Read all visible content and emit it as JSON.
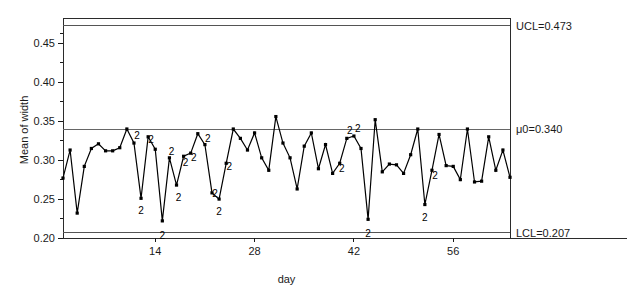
{
  "chart_data": {
    "type": "line",
    "title": "",
    "subtitle": "",
    "xlabel": "day",
    "ylabel": "Mean of width",
    "xlim": [
      1,
      64
    ],
    "ylim": [
      0.2,
      0.4775
    ],
    "grid": false,
    "legend": null,
    "x_ticks": [
      14,
      28,
      42,
      56
    ],
    "x_tick_labels": [
      "14",
      "28",
      "42",
      "56"
    ],
    "y_ticks": [
      0.2,
      0.25,
      0.3,
      0.35,
      0.4,
      0.45
    ],
    "y_tick_labels": [
      "0.20",
      "0.25",
      "0.30",
      "0.35",
      "0.40",
      "0.45"
    ],
    "y_minor_ticks": [
      0.225,
      0.275,
      0.325,
      0.375,
      0.425,
      0.4625
    ],
    "series": [
      {
        "name": "Mean of width",
        "x": [
          1,
          2,
          3,
          4,
          5,
          6,
          7,
          8,
          9,
          10,
          11,
          12,
          13,
          14,
          15,
          16,
          17,
          18,
          19,
          20,
          21,
          22,
          23,
          24,
          25,
          26,
          27,
          28,
          29,
          30,
          31,
          32,
          33,
          34,
          35,
          36,
          37,
          38,
          39,
          40,
          41,
          42,
          43,
          44,
          45,
          46,
          47,
          48,
          49,
          50,
          51,
          52,
          53,
          54,
          55,
          56,
          57,
          58,
          59,
          60,
          61,
          62,
          63,
          64
        ],
        "values": [
          0.277,
          0.313,
          0.232,
          0.292,
          0.315,
          0.321,
          0.312,
          0.312,
          0.316,
          0.34,
          0.322,
          0.251,
          0.33,
          0.314,
          0.222,
          0.303,
          0.268,
          0.305,
          0.309,
          0.334,
          0.32,
          0.258,
          0.25,
          0.296,
          0.34,
          0.328,
          0.313,
          0.335,
          0.303,
          0.287,
          0.356,
          0.322,
          0.303,
          0.263,
          0.318,
          0.335,
          0.289,
          0.32,
          0.283,
          0.296,
          0.328,
          0.331,
          0.315,
          0.224,
          0.352,
          0.285,
          0.295,
          0.294,
          0.283,
          0.307,
          0.34,
          0.243,
          0.287,
          0.333,
          0.293,
          0.292,
          0.275,
          0.34,
          0.272,
          0.273,
          0.33,
          0.287,
          0.313,
          0.278
        ]
      }
    ],
    "control_limits": {
      "ucl": {
        "value": 0.473,
        "label": "UCL=0.473"
      },
      "center": {
        "value": 0.34,
        "label": "μ0=0.340"
      },
      "lcl": {
        "value": 0.207,
        "label": "LCL=0.207"
      }
    },
    "violation_code": "2",
    "violations": [
      {
        "x": 11,
        "y": 0.322,
        "dx": 3,
        "dy": -4
      },
      {
        "x": 12,
        "y": 0.251,
        "dx": 0,
        "dy": 16
      },
      {
        "x": 13,
        "y": 0.33,
        "dx": 3,
        "dy": 6
      },
      {
        "x": 15,
        "y": 0.222,
        "dx": 0,
        "dy": 18
      },
      {
        "x": 16,
        "y": 0.303,
        "dx": 2,
        "dy": -3
      },
      {
        "x": 17,
        "y": 0.268,
        "dx": 2,
        "dy": 16
      },
      {
        "x": 18,
        "y": 0.305,
        "dx": 2,
        "dy": 10
      },
      {
        "x": 19,
        "y": 0.309,
        "dx": 3,
        "dy": 8
      },
      {
        "x": 21,
        "y": 0.32,
        "dx": 3,
        "dy": -3
      },
      {
        "x": 22,
        "y": 0.258,
        "dx": 3,
        "dy": 4
      },
      {
        "x": 23,
        "y": 0.25,
        "dx": 0,
        "dy": 16
      },
      {
        "x": 24,
        "y": 0.296,
        "dx": 3,
        "dy": 7
      },
      {
        "x": 40,
        "y": 0.296,
        "dx": 2,
        "dy": 9
      },
      {
        "x": 41,
        "y": 0.328,
        "dx": 3,
        "dy": -4
      },
      {
        "x": 42,
        "y": 0.331,
        "dx": 4,
        "dy": -4
      },
      {
        "x": 44,
        "y": 0.224,
        "dx": 0,
        "dy": 18
      },
      {
        "x": 52,
        "y": 0.243,
        "dx": 0,
        "dy": 16
      },
      {
        "x": 53,
        "y": 0.287,
        "dx": 3,
        "dy": 9
      }
    ]
  },
  "axis": {
    "ylabel": "Mean of width",
    "xlabel": "day"
  }
}
